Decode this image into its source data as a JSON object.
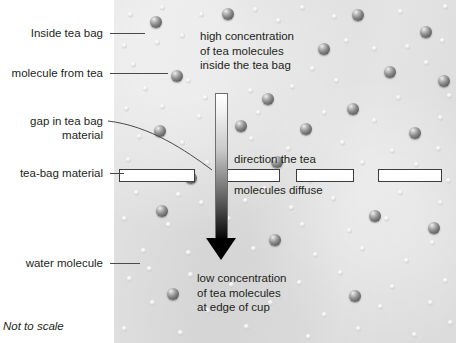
{
  "diagram": {
    "footnote": "Not to scale",
    "background_color": "#dedede",
    "ink_color": "#231f20"
  },
  "callouts": [
    {
      "id": "inside-tea-bag",
      "label": "Inside tea bag"
    },
    {
      "id": "molecule-from-tea",
      "label": "molecule from tea"
    },
    {
      "id": "gap-in-tea-bag",
      "label_line1": "gap in tea bag",
      "label_line2": "material"
    },
    {
      "id": "tea-bag-material",
      "label": "tea-bag material"
    },
    {
      "id": "water-molecule",
      "label": "water molecule"
    }
  ],
  "notes": {
    "high_concentration": {
      "line1": "high concentration",
      "line2": "of tea molecules",
      "line3": "inside the tea bag"
    },
    "direction_top": "direction the tea",
    "direction_bottom": "molecules diffuse",
    "low_concentration": {
      "line1": "low concentration",
      "line2": "of tea molecules",
      "line3": "at edge of cup"
    }
  },
  "legend": {
    "tea_molecule_color": "#6a6a6a",
    "water_molecule_color": "#e8e8e8",
    "arrow_color": "#000000",
    "bag_material_fill": "#ffffff",
    "bag_material_stroke": "#3d3d3d"
  },
  "bag_bars": [
    {
      "x": 119,
      "y": 169,
      "w": 76
    },
    {
      "x": 222,
      "y": 169,
      "w": 58
    },
    {
      "x": 296,
      "y": 169,
      "w": 58
    },
    {
      "x": 378,
      "y": 169,
      "w": 64
    }
  ],
  "tea_molecules": [
    {
      "x": 150,
      "y": 16,
      "d": 12
    },
    {
      "x": 222,
      "y": 8,
      "d": 12
    },
    {
      "x": 352,
      "y": 9,
      "d": 12
    },
    {
      "x": 420,
      "y": 26,
      "d": 12
    },
    {
      "x": 318,
      "y": 43,
      "d": 12
    },
    {
      "x": 171,
      "y": 70,
      "d": 12
    },
    {
      "x": 384,
      "y": 66,
      "d": 12
    },
    {
      "x": 438,
      "y": 75,
      "d": 12
    },
    {
      "x": 262,
      "y": 93,
      "d": 12
    },
    {
      "x": 347,
      "y": 103,
      "d": 12
    },
    {
      "x": 154,
      "y": 125,
      "d": 12
    },
    {
      "x": 235,
      "y": 120,
      "d": 12
    },
    {
      "x": 300,
      "y": 123,
      "d": 12
    },
    {
      "x": 409,
      "y": 127,
      "d": 12
    },
    {
      "x": 185,
      "y": 172,
      "d": 12
    },
    {
      "x": 271,
      "y": 156,
      "d": 12
    },
    {
      "x": 156,
      "y": 205,
      "d": 12
    },
    {
      "x": 369,
      "y": 210,
      "d": 12
    },
    {
      "x": 428,
      "y": 222,
      "d": 12
    },
    {
      "x": 269,
      "y": 234,
      "d": 12
    },
    {
      "x": 167,
      "y": 288,
      "d": 12
    },
    {
      "x": 349,
      "y": 290,
      "d": 12
    }
  ],
  "water_molecules": [
    {
      "x": 128,
      "y": 12,
      "d": 5
    },
    {
      "x": 160,
      "y": 5,
      "d": 5
    },
    {
      "x": 199,
      "y": 12,
      "d": 5
    },
    {
      "x": 253,
      "y": 7,
      "d": 5
    },
    {
      "x": 276,
      "y": 18,
      "d": 5
    },
    {
      "x": 300,
      "y": 5,
      "d": 5
    },
    {
      "x": 332,
      "y": 14,
      "d": 5
    },
    {
      "x": 398,
      "y": 9,
      "d": 5
    },
    {
      "x": 443,
      "y": 4,
      "d": 5
    },
    {
      "x": 122,
      "y": 43,
      "d": 5
    },
    {
      "x": 155,
      "y": 40,
      "d": 5
    },
    {
      "x": 180,
      "y": 33,
      "d": 5
    },
    {
      "x": 285,
      "y": 34,
      "d": 5
    },
    {
      "x": 344,
      "y": 38,
      "d": 5
    },
    {
      "x": 372,
      "y": 46,
      "d": 5
    },
    {
      "x": 405,
      "y": 44,
      "d": 5
    },
    {
      "x": 440,
      "y": 38,
      "d": 5
    },
    {
      "x": 131,
      "y": 62,
      "d": 5
    },
    {
      "x": 204,
      "y": 57,
      "d": 5
    },
    {
      "x": 246,
      "y": 64,
      "d": 5
    },
    {
      "x": 310,
      "y": 66,
      "d": 5
    },
    {
      "x": 424,
      "y": 60,
      "d": 5
    },
    {
      "x": 143,
      "y": 86,
      "d": 5
    },
    {
      "x": 186,
      "y": 78,
      "d": 5
    },
    {
      "x": 203,
      "y": 95,
      "d": 5
    },
    {
      "x": 248,
      "y": 88,
      "d": 5
    },
    {
      "x": 290,
      "y": 84,
      "d": 5
    },
    {
      "x": 334,
      "y": 78,
      "d": 5
    },
    {
      "x": 396,
      "y": 95,
      "d": 5
    },
    {
      "x": 447,
      "y": 93,
      "d": 5
    },
    {
      "x": 124,
      "y": 106,
      "d": 5
    },
    {
      "x": 160,
      "y": 104,
      "d": 5
    },
    {
      "x": 197,
      "y": 114,
      "d": 5
    },
    {
      "x": 256,
      "y": 110,
      "d": 5
    },
    {
      "x": 322,
      "y": 110,
      "d": 5
    },
    {
      "x": 372,
      "y": 118,
      "d": 5
    },
    {
      "x": 438,
      "y": 115,
      "d": 5
    },
    {
      "x": 137,
      "y": 134,
      "d": 5
    },
    {
      "x": 180,
      "y": 140,
      "d": 5
    },
    {
      "x": 249,
      "y": 136,
      "d": 5
    },
    {
      "x": 286,
      "y": 146,
      "d": 5
    },
    {
      "x": 340,
      "y": 140,
      "d": 5
    },
    {
      "x": 390,
      "y": 148,
      "d": 5
    },
    {
      "x": 436,
      "y": 146,
      "d": 5
    },
    {
      "x": 126,
      "y": 157,
      "d": 5
    },
    {
      "x": 205,
      "y": 160,
      "d": 5
    },
    {
      "x": 262,
      "y": 186,
      "d": 5
    },
    {
      "x": 308,
      "y": 178,
      "d": 5
    },
    {
      "x": 360,
      "y": 160,
      "d": 5
    },
    {
      "x": 414,
      "y": 162,
      "d": 5
    },
    {
      "x": 446,
      "y": 178,
      "d": 5
    },
    {
      "x": 134,
      "y": 190,
      "d": 5
    },
    {
      "x": 176,
      "y": 192,
      "d": 5
    },
    {
      "x": 199,
      "y": 200,
      "d": 5
    },
    {
      "x": 243,
      "y": 198,
      "d": 5
    },
    {
      "x": 289,
      "y": 205,
      "d": 5
    },
    {
      "x": 331,
      "y": 196,
      "d": 5
    },
    {
      "x": 398,
      "y": 190,
      "d": 5
    },
    {
      "x": 438,
      "y": 200,
      "d": 5
    },
    {
      "x": 122,
      "y": 216,
      "d": 5
    },
    {
      "x": 166,
      "y": 222,
      "d": 5
    },
    {
      "x": 226,
      "y": 216,
      "d": 5
    },
    {
      "x": 300,
      "y": 222,
      "d": 5
    },
    {
      "x": 347,
      "y": 228,
      "d": 5
    },
    {
      "x": 384,
      "y": 216,
      "d": 5
    },
    {
      "x": 430,
      "y": 240,
      "d": 5
    },
    {
      "x": 141,
      "y": 248,
      "d": 5
    },
    {
      "x": 186,
      "y": 250,
      "d": 5
    },
    {
      "x": 251,
      "y": 246,
      "d": 5
    },
    {
      "x": 313,
      "y": 252,
      "d": 5
    },
    {
      "x": 360,
      "y": 246,
      "d": 5
    },
    {
      "x": 404,
      "y": 258,
      "d": 5
    },
    {
      "x": 127,
      "y": 276,
      "d": 5
    },
    {
      "x": 188,
      "y": 272,
      "d": 5
    },
    {
      "x": 229,
      "y": 282,
      "d": 5
    },
    {
      "x": 297,
      "y": 280,
      "d": 5
    },
    {
      "x": 338,
      "y": 270,
      "d": 5
    },
    {
      "x": 390,
      "y": 284,
      "d": 5
    },
    {
      "x": 443,
      "y": 278,
      "d": 5
    },
    {
      "x": 150,
      "y": 300,
      "d": 5
    },
    {
      "x": 205,
      "y": 308,
      "d": 5
    },
    {
      "x": 268,
      "y": 300,
      "d": 5
    },
    {
      "x": 322,
      "y": 312,
      "d": 5
    },
    {
      "x": 378,
      "y": 304,
      "d": 5
    },
    {
      "x": 428,
      "y": 300,
      "d": 5
    },
    {
      "x": 122,
      "y": 326,
      "d": 5
    },
    {
      "x": 178,
      "y": 330,
      "d": 5
    },
    {
      "x": 244,
      "y": 324,
      "d": 5
    },
    {
      "x": 306,
      "y": 334,
      "d": 5
    },
    {
      "x": 356,
      "y": 326,
      "d": 5
    },
    {
      "x": 412,
      "y": 332,
      "d": 5
    },
    {
      "x": 448,
      "y": 320,
      "d": 5
    },
    {
      "x": 147,
      "y": 266,
      "d": 5
    }
  ]
}
